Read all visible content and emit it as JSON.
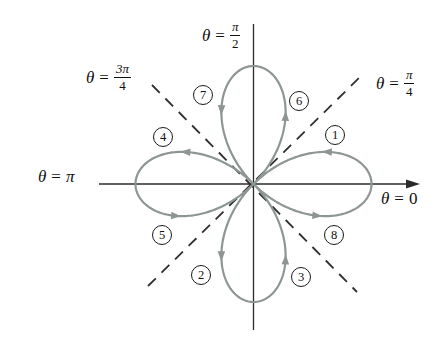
{
  "colors": {
    "background": "#ffffff",
    "curve": "#8d9695",
    "axis": "#2b2b2b",
    "dashed": "#2f2f2f",
    "text": "#101010"
  },
  "curve": {
    "type": "polar_rose",
    "petals": 4,
    "trace_direction": "theta increasing 0 to 2pi"
  },
  "geometry": {
    "cx": 253.5,
    "cy": 184,
    "amplitude": 118,
    "h_axis": {
      "x1": 99,
      "x2": 407,
      "tip": 420
    },
    "v_axis": {
      "y1": 24,
      "y2": 330
    },
    "dashed_lines": [
      {
        "x1": 148,
        "y1": 286,
        "x2": 360,
        "y2": 77
      },
      {
        "x1": 152,
        "y1": 85,
        "x2": 357,
        "y2": 292
      }
    ],
    "arrow_thetas": [
      0.41,
      1.15,
      1.97,
      2.7,
      3.53,
      4.27,
      5.12,
      5.82
    ]
  },
  "labels": {
    "pi_over_2": {
      "theta": "θ",
      "eq": "=",
      "num": "π",
      "den": "2"
    },
    "three_pi_over_4": {
      "theta": "θ",
      "eq": "=",
      "num": "3π",
      "den": "4"
    },
    "pi_over_4": {
      "theta": "θ",
      "eq": "=",
      "num": "π",
      "den": "4"
    },
    "pi": {
      "theta": "θ",
      "eq": "=",
      "value": "π"
    },
    "zero": {
      "theta": "θ",
      "eq": "=",
      "value": "0"
    }
  },
  "steps": [
    "1",
    "2",
    "3",
    "4",
    "5",
    "6",
    "7",
    "8"
  ]
}
